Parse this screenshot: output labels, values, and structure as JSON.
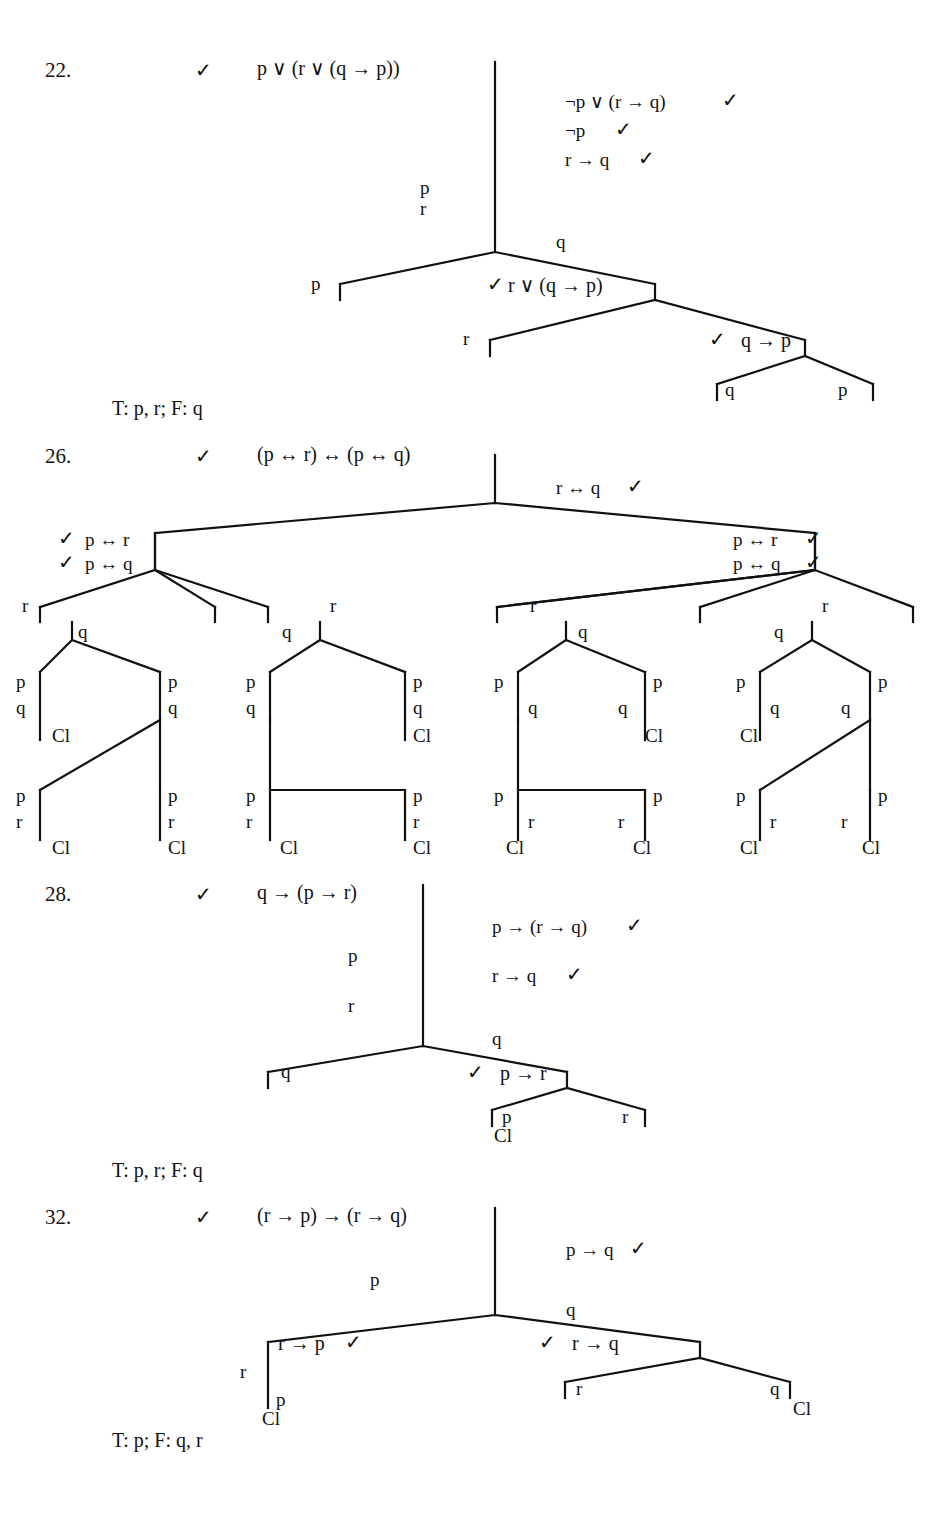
{
  "page": {
    "type": "logic-textbook-answer-page",
    "symbols": {
      "check": "✓",
      "or": "∨",
      "implies": "→",
      "iff": "↔",
      "not": "¬",
      "closed": "Cl"
    }
  },
  "problems": [
    {
      "number": "22.",
      "check": "✓",
      "root_formula": "p ∨ (r ∨ (q → p))",
      "right_stack": [
        {
          "text": "¬p ∨ (r → q)",
          "check": "✓"
        },
        {
          "text": "¬p",
          "check": "✓"
        },
        {
          "text": "r → q",
          "check": "✓"
        }
      ],
      "left_atoms": [
        "p",
        "r"
      ],
      "right_atoms": [
        "q"
      ],
      "branch_labels": {
        "b1_left": "p",
        "b1_right": "r ∨ (q → p)",
        "b1_right_check": "✓",
        "b2_left": "r",
        "b2_right": "q → p",
        "b2_right_check": "✓",
        "b3_left": "q",
        "b3_right": "p"
      },
      "conclusion": "T: p, r; F: q"
    },
    {
      "number": "26.",
      "check": "✓",
      "root_formula": "(p ↔ r) ↔ (p ↔ q)",
      "right_stack": [
        {
          "text": "r ↔ q",
          "check": "✓"
        }
      ],
      "left_branch_formulas": [
        {
          "check": "✓",
          "text": "p ↔ r"
        },
        {
          "check": "✓",
          "text": "p ↔ q"
        }
      ],
      "right_branch_formulas": [
        {
          "text": "p ↔ r",
          "check": "✓"
        },
        {
          "text": "p ↔ q",
          "check": "✓"
        }
      ],
      "subtrees": [
        {
          "id": "subtree-1",
          "top_left": "r",
          "top_right": "q",
          "nodes": [
            "p",
            "q",
            "Cl",
            "p",
            "q",
            "p",
            "r",
            "Cl",
            "p",
            "r",
            "Cl"
          ]
        },
        {
          "id": "subtree-2",
          "top_left": "q",
          "top_right": "r",
          "nodes": [
            "p",
            "q",
            "p",
            "q",
            "Cl",
            "p",
            "r",
            "Cl",
            "p",
            "r",
            "Cl"
          ]
        },
        {
          "id": "subtree-3",
          "top_left": "r",
          "top_right": "q",
          "nodes": [
            "p",
            "q",
            "q",
            "p",
            "Cl",
            "p",
            "r",
            "Cl",
            "r",
            "p",
            "Cl"
          ]
        },
        {
          "id": "subtree-4",
          "top_left": "q",
          "top_right": "r",
          "nodes": [
            "p",
            "q",
            "Cl",
            "q",
            "p",
            "p",
            "r",
            "Cl",
            "r",
            "p",
            "Cl"
          ]
        }
      ]
    },
    {
      "number": "28.",
      "check": "✓",
      "root_formula": "q → (p → r)",
      "right_stack": [
        {
          "text": "p → (r → q)",
          "check": "✓"
        },
        {
          "text": "r → q",
          "check": "✓"
        }
      ],
      "left_atoms": [
        "p",
        "r"
      ],
      "right_atoms": [
        "q"
      ],
      "branch_labels": {
        "b1_left": "q",
        "b1_right": "p → r",
        "b1_right_check": "✓",
        "b2_left": "p",
        "b2_left_closed": "Cl",
        "b2_right": "r"
      },
      "conclusion": "T: p, r; F: q"
    },
    {
      "number": "32.",
      "check": "✓",
      "root_formula": "(r → p) → (r → q)",
      "right_stack": [
        {
          "text": "p → q",
          "check": "✓"
        }
      ],
      "left_atoms": [
        "p"
      ],
      "right_atoms": [
        "q"
      ],
      "branch_labels": {
        "b1_left": "r → p",
        "b1_left_check": "✓",
        "b1_left_atom": "r",
        "b1_left_atom2": "p",
        "b1_left_closed": "Cl",
        "b1_right": "r → q",
        "b1_right_check": "✓",
        "b2_left": "r",
        "b2_right": "q",
        "b2_right_closed": "Cl"
      },
      "conclusion": "T: p; F: q, r"
    }
  ]
}
